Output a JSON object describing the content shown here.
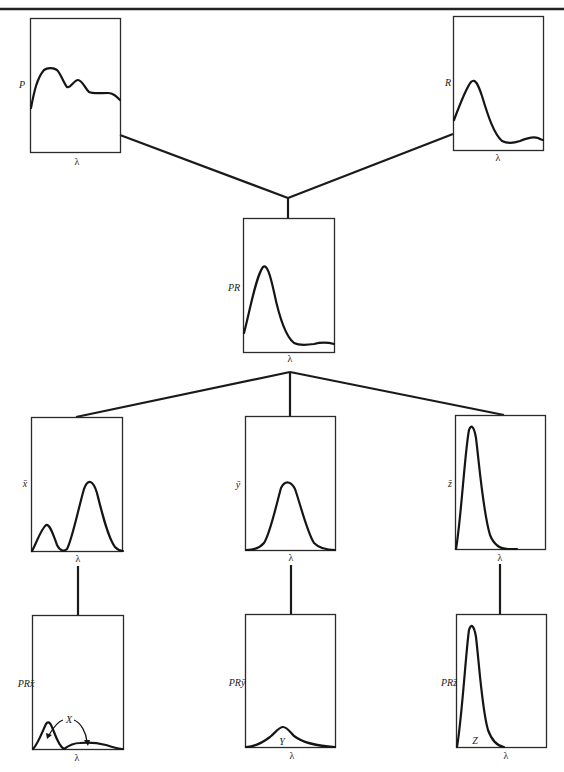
{
  "figure": {
    "nodes": {
      "p": {
        "y_label": "P",
        "x_label": "λ"
      },
      "r": {
        "y_label": "R",
        "x_label": "λ"
      },
      "pr": {
        "y_label": "PR",
        "x_label": "λ"
      },
      "xbar": {
        "y_label": "x̄",
        "x_label": "λ"
      },
      "ybar": {
        "y_label": "ȳ",
        "x_label": "λ"
      },
      "zbar": {
        "y_label": "z̄",
        "x_label": "λ"
      },
      "prx": {
        "y_label": "PRx̄",
        "x_label": "λ",
        "area_label": "X"
      },
      "pry": {
        "y_label": "PRȳ",
        "x_label": "λ",
        "area_label": "Y"
      },
      "prz": {
        "y_label": "PRz̄",
        "x_label": "λ",
        "area_label": "Z"
      }
    },
    "edges": [
      {
        "from": "p",
        "to": "pr"
      },
      {
        "from": "r",
        "to": "pr"
      },
      {
        "from": "pr",
        "to": "xbar"
      },
      {
        "from": "pr",
        "to": "ybar"
      },
      {
        "from": "pr",
        "to": "zbar"
      },
      {
        "from": "xbar",
        "to": "prx"
      },
      {
        "from": "ybar",
        "to": "pry"
      },
      {
        "from": "zbar",
        "to": "prz"
      }
    ],
    "colors": {
      "ink": "#1a1a1a",
      "background": "#ffffff"
    }
  }
}
